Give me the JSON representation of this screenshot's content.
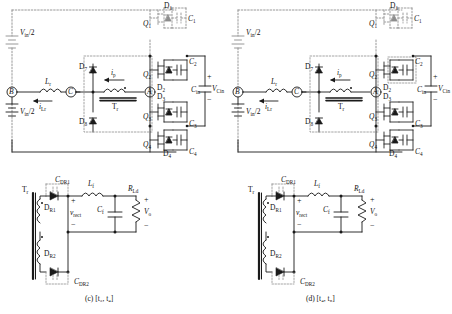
{
  "figure": {
    "type": "circuit-schematic",
    "panel_count": 2
  },
  "panels": [
    {
      "id": "c",
      "caption_prefix": "(c)",
      "caption_interval": "[t3, t4]",
      "caption": "(c) [t₃, t₄]",
      "primary": {
        "sources": [
          {
            "name": "Vin2_top",
            "label": "Vin/2"
          },
          {
            "name": "Vin2_bottom",
            "label": "Vin/2"
          }
        ],
        "nodes": [
          {
            "name": "node-B",
            "label": "B"
          },
          {
            "name": "node-C",
            "label": "C"
          },
          {
            "name": "node-A",
            "label": "A"
          }
        ],
        "inductor": {
          "label": "Lr"
        },
        "transformer": {
          "label": "Tr"
        },
        "currents": [
          {
            "name": "i-Lr",
            "label": "iLr"
          },
          {
            "name": "i-p",
            "label": "ip"
          }
        ],
        "switches": [
          {
            "name": "Q1",
            "label": "Q1",
            "diode": "D1",
            "cap": "C1"
          },
          {
            "name": "Q2",
            "label": "Q2",
            "diode": "D2",
            "cap": "C2"
          },
          {
            "name": "Q3",
            "label": "Q3",
            "diode": "D3",
            "cap": "C3"
          },
          {
            "name": "Q4",
            "label": "Q4",
            "diode": "D4",
            "cap": "C4"
          }
        ],
        "clamp_diodes": [
          {
            "name": "D7",
            "label": "D7"
          },
          {
            "name": "D8",
            "label": "D8"
          }
        ],
        "flying_cap": {
          "label": "Cin",
          "voltage": "VCin",
          "plus": "+",
          "minus": "−"
        }
      },
      "secondary": {
        "transformer": {
          "label": "Tr"
        },
        "rectifier_diodes": [
          {
            "name": "DR1",
            "label": "DR1"
          },
          {
            "name": "DR2",
            "label": "DR2"
          }
        ],
        "snubber_caps": [
          {
            "name": "CDR1",
            "label": "CDR1"
          },
          {
            "name": "CDR2",
            "label": "CDR2"
          }
        ],
        "filter_inductor": {
          "label": "Lf"
        },
        "filter_cap": {
          "label": "Cf"
        },
        "load": {
          "label": "RLd"
        },
        "rect_voltage": {
          "label": "vrect",
          "plus": "+",
          "minus": "−"
        },
        "out_voltage": {
          "label": "Vo",
          "plus": "+",
          "minus": "−"
        }
      }
    },
    {
      "id": "d",
      "caption_prefix": "(d)",
      "caption_interval": "[t4, t5]",
      "caption": "(d) [t₄, t₅]",
      "primary": {
        "sources": [
          {
            "name": "Vin2_top",
            "label": "Vin/2"
          },
          {
            "name": "Vin2_bottom",
            "label": "Vin/2"
          }
        ],
        "nodes": [
          {
            "name": "node-B",
            "label": "B"
          },
          {
            "name": "node-C",
            "label": "C"
          },
          {
            "name": "node-A",
            "label": "A"
          }
        ],
        "inductor": {
          "label": "Lr"
        },
        "transformer": {
          "label": "Tr"
        },
        "currents": [
          {
            "name": "i-Lr",
            "label": "iLr"
          },
          {
            "name": "i-p",
            "label": "ip"
          }
        ],
        "switches": [
          {
            "name": "Q1",
            "label": "Q1",
            "diode": "D1",
            "cap": "C1"
          },
          {
            "name": "Q2",
            "label": "Q2",
            "diode": "D2",
            "cap": "C2"
          },
          {
            "name": "Q3",
            "label": "Q3",
            "diode": "D3",
            "cap": "C3"
          },
          {
            "name": "Q4",
            "label": "Q4",
            "diode": "D4",
            "cap": "C4"
          }
        ],
        "clamp_diodes": [
          {
            "name": "D7",
            "label": "D7"
          },
          {
            "name": "D8",
            "label": "D8"
          }
        ],
        "flying_cap": {
          "label": "Cin",
          "voltage": "VCin",
          "plus": "+",
          "minus": "−"
        }
      },
      "secondary": {
        "transformer": {
          "label": "Tr"
        },
        "rectifier_diodes": [
          {
            "name": "DR1",
            "label": "DR1"
          },
          {
            "name": "DR2",
            "label": "DR2"
          }
        ],
        "snubber_caps": [
          {
            "name": "CDR1",
            "label": "CDR1"
          },
          {
            "name": "CDR2",
            "label": "CDR2"
          }
        ],
        "filter_inductor": {
          "label": "Lf"
        },
        "filter_cap": {
          "label": "Cf"
        },
        "load": {
          "label": "RLd"
        },
        "rect_voltage": {
          "label": "vrect",
          "plus": "+",
          "minus": "−"
        },
        "out_voltage": {
          "label": "Vo",
          "plus": "+",
          "minus": "−"
        }
      }
    }
  ],
  "colors": {
    "line": "#1a1a1a",
    "inactive": "#9a9a9a",
    "background": "#ffffff"
  }
}
